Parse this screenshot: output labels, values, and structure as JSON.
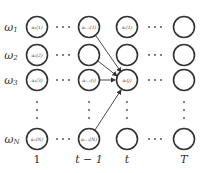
{
  "diagram": {
    "title": "",
    "row_labels": [
      {
        "base": "ω",
        "sub": "1"
      },
      {
        "base": "ω",
        "sub": "2"
      },
      {
        "base": "ω",
        "sub": "3"
      },
      {
        "base": "ω",
        "sub": "N"
      }
    ],
    "column_labels": [
      "1",
      "t − 1",
      "t",
      "T"
    ],
    "nodes": {
      "col1": [
        "α₁(1)",
        "α₁(2)",
        "α₁(3)",
        "α₁(N)"
      ],
      "col_t_minus_1": [
        "αₜ₋₁(1)",
        "",
        "αₜ₋₁(i)",
        "αₜ₋₁(N)"
      ],
      "col_t": [
        "αₜ(1)",
        "",
        "αₜ(j)",
        ""
      ],
      "col_T": [
        "",
        "",
        "",
        ""
      ]
    },
    "edges": [
      {
        "from": "αₜ₋₁(1)",
        "to": "αₜ(j)"
      },
      {
        "from": "t-1 row 2",
        "to": "αₜ(j)"
      },
      {
        "from": "αₜ₋₁(i)",
        "to": "αₜ(j)"
      },
      {
        "from": "αₜ₋₁(N)",
        "to": "αₜ(j)"
      }
    ],
    "colors": {
      "stroke": "#333333",
      "background": "#ffffff"
    }
  }
}
